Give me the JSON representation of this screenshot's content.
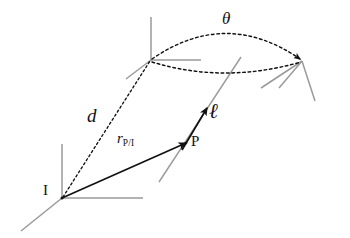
{
  "figure": {
    "width": 350,
    "height": 238,
    "background_color": "#ffffff",
    "axis_color": "#9a9a9a",
    "ink_color": "#111111"
  },
  "labels": {
    "point_i": "I",
    "point_p": "P",
    "distance_d": "d",
    "position_vector": "r",
    "position_vector_subscript": "P/I",
    "axis_line": "ℓ",
    "rotation_angle": "θ"
  },
  "geometry": {
    "point_i": {
      "x": 62,
      "y": 198
    },
    "point_p": {
      "x": 186,
      "y": 143
    },
    "frame_origin_upper": {
      "x": 151,
      "y": 60
    },
    "arc_arrow_tip": {
      "x": 301,
      "y": 61
    },
    "ell_arrow_tip": {
      "x": 207,
      "y": 108
    },
    "arc_apex_upper": {
      "x": 226,
      "y": 25
    },
    "arc_apex_lower": {
      "x": 222,
      "y": 73
    }
  },
  "elements": {
    "vector_r_label_pos": {
      "x": 118,
      "y": 133
    },
    "vector_d_label_pos": {
      "x": 88,
      "y": 108
    },
    "label_i_pos": {
      "x": 43,
      "y": 185
    },
    "label_p_pos": {
      "x": 191,
      "y": 136
    },
    "label_ell_pos": {
      "x": 209,
      "y": 105
    },
    "label_theta_pos": {
      "x": 223,
      "y": 12
    }
  }
}
